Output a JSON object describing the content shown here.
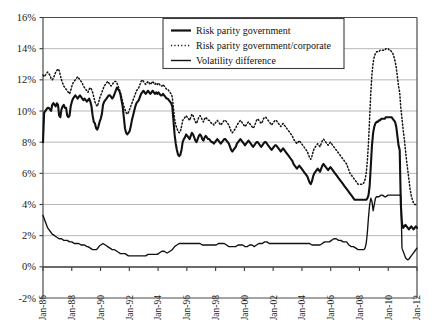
{
  "chart_data": {
    "type": "line",
    "title": "",
    "xlabel": "",
    "ylabel": "",
    "ylim": [
      -2,
      16
    ],
    "ytick_step": 2,
    "grid": true,
    "legend_position": "top-center",
    "ytick_labels": [
      "16%",
      "14%",
      "12%",
      "10%",
      "8%",
      "6%",
      "4%",
      "2%",
      "0%",
      "-2%"
    ],
    "ytick_values": [
      16,
      14,
      12,
      10,
      8,
      6,
      4,
      2,
      0,
      -2
    ],
    "xtick_labels": [
      "Jan-86",
      "Jan-88",
      "Jan-90",
      "Jan-92",
      "Jan-94",
      "Jan-96",
      "Jan-98",
      "Jan-00",
      "Jan-02",
      "Jan-04",
      "Jan-06",
      "Jan-08",
      "Jan-10",
      "Jan-12"
    ],
    "x_start": "Jan-86",
    "x_end": "Jan-12",
    "x_frequency": "monthly",
    "series": [
      {
        "name": "Risk parity government",
        "style": "solid-thick",
        "color": "#111111",
        "values": [
          8.0,
          9.9,
          10.0,
          10.1,
          10.2,
          10.2,
          10.1,
          10.0,
          10.4,
          10.5,
          10.4,
          10.3,
          10.5,
          10.4,
          9.7,
          9.6,
          10.1,
          10.3,
          10.4,
          10.2,
          10.2,
          9.7,
          9.6,
          9.7,
          10.3,
          10.6,
          10.8,
          10.9,
          11.0,
          10.9,
          10.8,
          10.9,
          11.0,
          10.9,
          10.8,
          10.7,
          10.8,
          10.7,
          10.6,
          10.7,
          10.8,
          10.6,
          10.3,
          9.7,
          9.3,
          9.2,
          8.9,
          8.8,
          9.0,
          9.3,
          9.5,
          9.8,
          10.4,
          10.6,
          10.7,
          10.8,
          10.9,
          11.0,
          11.0,
          10.9,
          10.8,
          10.9,
          11.1,
          11.3,
          11.5,
          11.4,
          11.3,
          11.1,
          10.7,
          10.3,
          9.6,
          8.9,
          8.6,
          8.5,
          8.6,
          8.7,
          9.0,
          9.4,
          9.7,
          10.0,
          10.3,
          10.5,
          10.6,
          10.7,
          10.9,
          11.1,
          11.2,
          11.3,
          11.2,
          11.1,
          11.2,
          11.3,
          11.2,
          11.1,
          11.2,
          11.3,
          11.2,
          11.1,
          11.2,
          11.1,
          11.2,
          11.1,
          11.0,
          11.0,
          11.1,
          11.0,
          10.9,
          10.8,
          10.8,
          10.7,
          10.6,
          10.5,
          10.3,
          9.4,
          8.5,
          7.9,
          7.5,
          7.2,
          7.1,
          7.2,
          7.5,
          8.0,
          8.2,
          8.3,
          8.5,
          8.4,
          8.3,
          8.2,
          8.4,
          8.6,
          8.5,
          8.3,
          8.1,
          8.0,
          8.2,
          8.4,
          8.5,
          8.4,
          8.2,
          8.1,
          8.3,
          8.4,
          8.3,
          8.2,
          8.2,
          8.1,
          8.0,
          8.0,
          7.9,
          8.0,
          8.1,
          8.2,
          8.1,
          8.0,
          7.9,
          8.0,
          8.1,
          8.2,
          8.2,
          8.1,
          8.0,
          7.9,
          7.7,
          7.5,
          7.4,
          7.5,
          7.6,
          7.7,
          7.9,
          8.0,
          8.1,
          8.2,
          8.1,
          8.0,
          7.9,
          7.8,
          7.9,
          8.0,
          8.1,
          8.0,
          7.9,
          7.8,
          7.7,
          7.8,
          7.9,
          8.0,
          8.0,
          7.9,
          7.8,
          7.7,
          7.8,
          7.9,
          8.0,
          8.0,
          7.9,
          7.8,
          7.7,
          7.6,
          7.5,
          7.6,
          7.7,
          7.8,
          7.8,
          7.7,
          7.6,
          7.5,
          7.4,
          7.5,
          7.6,
          7.5,
          7.4,
          7.3,
          7.2,
          7.1,
          7.0,
          6.9,
          6.8,
          6.6,
          6.5,
          6.4,
          6.3,
          6.4,
          6.5,
          6.4,
          6.3,
          6.2,
          6.1,
          6.0,
          5.9,
          5.8,
          5.6,
          5.4,
          5.3,
          5.5,
          5.8,
          6.0,
          6.1,
          6.2,
          6.3,
          6.2,
          6.1,
          6.3,
          6.5,
          6.6,
          6.5,
          6.4,
          6.3,
          6.2,
          6.3,
          6.4,
          6.3,
          6.2,
          6.1,
          6.0,
          5.9,
          5.8,
          5.7,
          5.6,
          5.5,
          5.4,
          5.3,
          5.2,
          5.1,
          5.0,
          4.9,
          4.8,
          4.7,
          4.6,
          4.5,
          4.4,
          4.3,
          4.3,
          4.3,
          4.3,
          4.3,
          4.3,
          4.3,
          4.3,
          4.3,
          4.3,
          4.3,
          4.4,
          4.6,
          5.2,
          6.5,
          7.8,
          8.6,
          9.0,
          9.2,
          9.3,
          9.3,
          9.4,
          9.4,
          9.5,
          9.5,
          9.5,
          9.5,
          9.6,
          9.6,
          9.6,
          9.6,
          9.6,
          9.6,
          9.5,
          9.4,
          9.3,
          9.0,
          8.4,
          7.8,
          7.5,
          4.0,
          2.8,
          2.5,
          2.6,
          2.7,
          2.6,
          2.5,
          2.4,
          2.5,
          2.6,
          2.5,
          2.4,
          2.5,
          2.6,
          2.5
        ]
      },
      {
        "name": "Risk parity government/corporate",
        "style": "dotted",
        "color": "#141414",
        "values": [
          12.3,
          12.2,
          12.3,
          12.4,
          12.5,
          12.4,
          12.3,
          12.1,
          12.0,
          12.1,
          12.3,
          12.5,
          12.6,
          12.7,
          12.6,
          12.3,
          12.0,
          11.8,
          11.6,
          11.5,
          11.4,
          11.3,
          11.2,
          11.1,
          11.3,
          11.6,
          11.8,
          11.9,
          12.0,
          12.1,
          12.2,
          12.1,
          12.0,
          11.9,
          11.8,
          11.6,
          11.5,
          11.4,
          11.3,
          11.2,
          11.4,
          11.5,
          11.4,
          11.2,
          10.9,
          10.6,
          10.4,
          10.3,
          10.5,
          10.8,
          11.0,
          11.2,
          11.4,
          11.6,
          11.7,
          11.8,
          11.9,
          11.8,
          11.7,
          11.6,
          11.7,
          11.8,
          11.9,
          11.9,
          11.8,
          11.6,
          11.4,
          11.2,
          10.9,
          10.6,
          10.3,
          10.1,
          9.9,
          9.8,
          9.9,
          10.1,
          10.3,
          10.5,
          10.7,
          10.9,
          11.1,
          11.3,
          11.4,
          11.5,
          11.7,
          11.9,
          12.0,
          11.9,
          11.8,
          11.7,
          11.8,
          11.9,
          11.8,
          11.7,
          11.8,
          11.9,
          11.8,
          11.7,
          11.8,
          11.7,
          11.8,
          11.7,
          11.6,
          11.6,
          11.7,
          11.6,
          11.5,
          11.4,
          11.4,
          11.3,
          11.2,
          11.1,
          10.9,
          10.2,
          9.5,
          9.1,
          8.9,
          8.7,
          8.6,
          8.7,
          9.0,
          9.4,
          9.5,
          9.6,
          9.7,
          9.6,
          9.5,
          9.4,
          9.6,
          9.8,
          9.7,
          9.5,
          9.3,
          9.2,
          9.4,
          9.6,
          9.7,
          9.6,
          9.4,
          9.3,
          9.5,
          9.6,
          9.5,
          9.4,
          9.4,
          9.3,
          9.2,
          9.2,
          9.1,
          9.2,
          9.3,
          9.4,
          9.3,
          9.2,
          9.1,
          9.2,
          9.3,
          9.4,
          9.4,
          9.3,
          9.2,
          9.1,
          8.9,
          8.7,
          8.6,
          8.7,
          8.8,
          8.9,
          9.1,
          9.2,
          9.3,
          9.4,
          9.3,
          9.2,
          9.1,
          9.0,
          9.1,
          9.2,
          9.3,
          9.2,
          9.1,
          9.0,
          8.9,
          9.0,
          9.2,
          9.4,
          9.5,
          9.4,
          9.3,
          9.2,
          9.3,
          9.5,
          9.6,
          9.6,
          9.5,
          9.4,
          9.3,
          9.2,
          9.1,
          9.2,
          9.3,
          9.4,
          9.4,
          9.3,
          9.2,
          9.1,
          9.0,
          9.1,
          9.2,
          9.1,
          9.0,
          8.9,
          8.8,
          8.7,
          8.6,
          8.5,
          8.4,
          8.2,
          8.1,
          8.0,
          7.9,
          8.0,
          8.1,
          8.0,
          7.9,
          7.8,
          7.7,
          7.6,
          7.5,
          7.4,
          7.2,
          7.0,
          6.9,
          7.1,
          7.4,
          7.6,
          7.7,
          7.8,
          7.9,
          7.8,
          7.7,
          7.9,
          8.1,
          8.2,
          8.1,
          8.0,
          7.9,
          7.8,
          7.9,
          8.0,
          7.9,
          7.8,
          7.7,
          7.6,
          7.5,
          7.4,
          7.3,
          7.2,
          7.1,
          7.0,
          6.9,
          6.8,
          6.7,
          6.6,
          6.4,
          6.2,
          6.0,
          5.9,
          5.8,
          5.7,
          5.6,
          5.5,
          5.4,
          5.3,
          5.3,
          5.3,
          5.3,
          5.3,
          5.4,
          5.6,
          6.0,
          6.8,
          8.0,
          9.6,
          11.2,
          12.4,
          13.1,
          13.5,
          13.7,
          13.8,
          13.8,
          13.8,
          13.9,
          13.9,
          13.9,
          13.9,
          13.9,
          14.0,
          14.0,
          14.0,
          13.9,
          13.9,
          13.8,
          13.7,
          13.5,
          13.2,
          12.8,
          12.2,
          11.6,
          11.2,
          10.2,
          9.5,
          8.8,
          8.2,
          7.5,
          6.8,
          6.2,
          5.6,
          5.0,
          4.6,
          4.3,
          4.1,
          4.0,
          4.0,
          4.0
        ]
      },
      {
        "name": "Volatility difference",
        "style": "solid-thin",
        "color": "#111111",
        "values": [
          3.3,
          3.1,
          2.9,
          2.7,
          2.5,
          2.4,
          2.3,
          2.2,
          2.1,
          2.05,
          2.0,
          1.95,
          1.9,
          1.85,
          1.8,
          1.8,
          1.8,
          1.75,
          1.7,
          1.7,
          1.7,
          1.7,
          1.65,
          1.6,
          1.6,
          1.6,
          1.55,
          1.5,
          1.5,
          1.5,
          1.5,
          1.5,
          1.45,
          1.4,
          1.4,
          1.4,
          1.4,
          1.35,
          1.3,
          1.3,
          1.25,
          1.2,
          1.15,
          1.1,
          1.1,
          1.1,
          1.1,
          1.15,
          1.25,
          1.35,
          1.4,
          1.45,
          1.5,
          1.45,
          1.4,
          1.35,
          1.3,
          1.25,
          1.2,
          1.15,
          1.1,
          1.1,
          1.1,
          1.05,
          1.0,
          0.95,
          0.9,
          0.85,
          0.85,
          0.85,
          0.85,
          0.85,
          0.8,
          0.75,
          0.7,
          0.7,
          0.7,
          0.7,
          0.7,
          0.7,
          0.7,
          0.7,
          0.7,
          0.7,
          0.7,
          0.7,
          0.7,
          0.7,
          0.7,
          0.7,
          0.75,
          0.8,
          0.8,
          0.8,
          0.8,
          0.8,
          0.8,
          0.8,
          0.8,
          0.8,
          0.85,
          0.9,
          0.95,
          1.0,
          1.0,
          1.0,
          0.95,
          0.9,
          0.9,
          0.95,
          1.0,
          1.05,
          1.1,
          1.2,
          1.3,
          1.35,
          1.4,
          1.45,
          1.5,
          1.5,
          1.5,
          1.5,
          1.5,
          1.5,
          1.5,
          1.5,
          1.5,
          1.5,
          1.5,
          1.5,
          1.5,
          1.5,
          1.5,
          1.5,
          1.5,
          1.5,
          1.5,
          1.45,
          1.4,
          1.4,
          1.4,
          1.4,
          1.4,
          1.4,
          1.4,
          1.4,
          1.4,
          1.4,
          1.4,
          1.4,
          1.4,
          1.45,
          1.5,
          1.5,
          1.5,
          1.5,
          1.5,
          1.5,
          1.45,
          1.4,
          1.35,
          1.3,
          1.3,
          1.3,
          1.3,
          1.3,
          1.3,
          1.3,
          1.35,
          1.4,
          1.4,
          1.4,
          1.4,
          1.4,
          1.35,
          1.3,
          1.3,
          1.3,
          1.35,
          1.4,
          1.4,
          1.4,
          1.35,
          1.3,
          1.35,
          1.4,
          1.45,
          1.5,
          1.5,
          1.5,
          1.5,
          1.55,
          1.6,
          1.6,
          1.6,
          1.55,
          1.5,
          1.5,
          1.5,
          1.5,
          1.5,
          1.5,
          1.5,
          1.5,
          1.5,
          1.5,
          1.5,
          1.5,
          1.5,
          1.5,
          1.5,
          1.5,
          1.5,
          1.5,
          1.5,
          1.5,
          1.5,
          1.5,
          1.5,
          1.5,
          1.5,
          1.5,
          1.5,
          1.5,
          1.5,
          1.5,
          1.5,
          1.5,
          1.5,
          1.5,
          1.5,
          1.5,
          1.45,
          1.4,
          1.4,
          1.4,
          1.4,
          1.4,
          1.4,
          1.4,
          1.4,
          1.45,
          1.5,
          1.55,
          1.6,
          1.6,
          1.6,
          1.6,
          1.6,
          1.65,
          1.7,
          1.75,
          1.8,
          1.8,
          1.8,
          1.75,
          1.7,
          1.7,
          1.7,
          1.65,
          1.6,
          1.6,
          1.6,
          1.6,
          1.5,
          1.4,
          1.35,
          1.3,
          1.3,
          1.3,
          1.25,
          1.2,
          1.15,
          1.1,
          1.1,
          1.1,
          1.1,
          1.1,
          1.1,
          1.2,
          1.5,
          2.2,
          3.2,
          4.0,
          4.4,
          4.2,
          3.6,
          4.0,
          4.4,
          4.5,
          4.5,
          4.5,
          4.55,
          4.6,
          4.6,
          4.55,
          4.5,
          4.5,
          4.55,
          4.6,
          4.6,
          4.6,
          4.6,
          4.6,
          4.6,
          4.6,
          4.6,
          4.6,
          4.6,
          4.6,
          4.55,
          1.2,
          1.0,
          0.8,
          0.6,
          0.5,
          0.45,
          0.5,
          0.6,
          0.7,
          0.8,
          0.9,
          1.0,
          1.1,
          1.2
        ]
      }
    ]
  },
  "legend": {
    "items": [
      {
        "label": "Risk parity government",
        "style": "solid-thick"
      },
      {
        "label": "Risk parity government/corporate",
        "style": "dotted"
      },
      {
        "label": "Volatility difference",
        "style": "solid-thin"
      }
    ]
  },
  "colors": {
    "line": "#111111",
    "gridline": "#b9b9b9",
    "axis": "#3a3a3a",
    "background": "#ffffff"
  }
}
